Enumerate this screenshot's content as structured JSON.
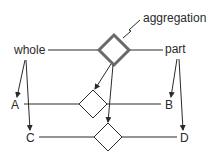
{
  "diagram": {
    "type": "aggregation-notation",
    "labels": {
      "aggregation": "aggregation",
      "whole": "whole",
      "part": "part",
      "A": "A",
      "B": "B",
      "C": "C",
      "D": "D"
    },
    "colors": {
      "line": "#2a2a2a",
      "double_diamond": "#6a6a6a",
      "background": "#ffffff"
    },
    "nodes": [
      {
        "id": "top",
        "kind": "aggregation-diamond",
        "style": "double-outline"
      },
      {
        "id": "ab",
        "kind": "relationship-diamond",
        "connects": [
          "A",
          "B"
        ]
      },
      {
        "id": "cd",
        "kind": "relationship-diamond",
        "connects": [
          "C",
          "D"
        ]
      }
    ],
    "arrows": [
      {
        "from": "whole",
        "to": "A"
      },
      {
        "from": "whole",
        "to": "C"
      },
      {
        "from": "part",
        "to": "B"
      },
      {
        "from": "part",
        "to": "D"
      },
      {
        "from": "top",
        "to": "ab"
      },
      {
        "from": "top",
        "to": "cd"
      }
    ]
  }
}
